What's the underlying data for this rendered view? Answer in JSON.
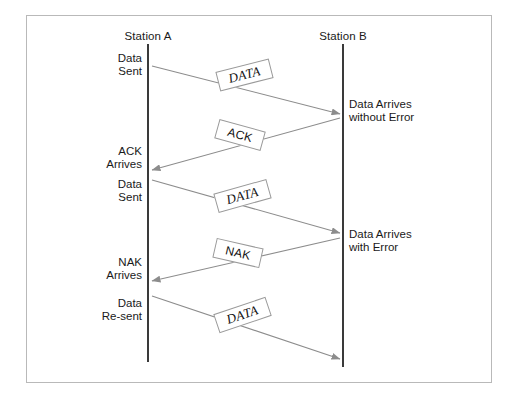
{
  "diagram": {
    "title_alt": "Stop-and-Wait ARQ sequence diagram",
    "frame_color": "#b9b9b9",
    "lifeline_color": "#3a3a3a",
    "arrow_color": "#8c8c8c",
    "text_color": "#1a1a1a"
  },
  "stations": [
    {
      "id": "a",
      "label": "Station A",
      "x": 148
    },
    {
      "id": "b",
      "label": "Station B",
      "x": 343
    }
  ],
  "left_events": [
    {
      "id": "data-sent-1",
      "lines": [
        "Data",
        "Sent"
      ],
      "y": 52
    },
    {
      "id": "ack-arrives",
      "lines": [
        "ACK",
        "Arrives"
      ],
      "y": 145
    },
    {
      "id": "data-sent-2",
      "lines": [
        "Data",
        "Sent"
      ],
      "y": 178
    },
    {
      "id": "nak-arrives",
      "lines": [
        "NAK",
        "Arrives"
      ],
      "y": 256
    },
    {
      "id": "data-resent",
      "lines": [
        "Data",
        "Re-sent"
      ],
      "y": 297
    }
  ],
  "right_events": [
    {
      "id": "data-arrives-ok",
      "lines": [
        "Data Arrives",
        "without Error"
      ],
      "y": 98
    },
    {
      "id": "data-arrives-error",
      "lines": [
        "Data Arrives",
        "with Error"
      ],
      "y": 228
    }
  ],
  "messages": [
    {
      "id": "data-1",
      "label": "DATA",
      "style": "data",
      "direction": "a-to-b",
      "x1": 152,
      "y1": 66,
      "x2": 340,
      "y2": 114,
      "box": {
        "cx": 245,
        "cy": 75,
        "w": 55,
        "h": 20,
        "rotate": -14.3
      }
    },
    {
      "id": "ack-1",
      "label": "ACK",
      "style": "ctrl",
      "direction": "b-to-a",
      "x1": 340,
      "y1": 118,
      "x2": 152,
      "y2": 170,
      "box": {
        "cx": 240,
        "cy": 135,
        "w": 48,
        "h": 20,
        "rotate": 15.5
      }
    },
    {
      "id": "data-2",
      "label": "DATA",
      "style": "data",
      "direction": "a-to-b",
      "x1": 152,
      "y1": 180,
      "x2": 340,
      "y2": 233,
      "box": {
        "cx": 243,
        "cy": 196,
        "w": 55,
        "h": 20,
        "rotate": -15.7
      }
    },
    {
      "id": "nak-1",
      "label": "NAK",
      "style": "ctrl",
      "direction": "b-to-a",
      "x1": 340,
      "y1": 238,
      "x2": 152,
      "y2": 281,
      "box": {
        "cx": 238,
        "cy": 253,
        "w": 48,
        "h": 20,
        "rotate": 12.9
      }
    },
    {
      "id": "data-3",
      "label": "DATA",
      "style": "data",
      "direction": "a-to-b",
      "x1": 152,
      "y1": 296,
      "x2": 340,
      "y2": 359,
      "box": {
        "cx": 243,
        "cy": 315,
        "w": 55,
        "h": 20,
        "rotate": -18.6
      }
    }
  ]
}
